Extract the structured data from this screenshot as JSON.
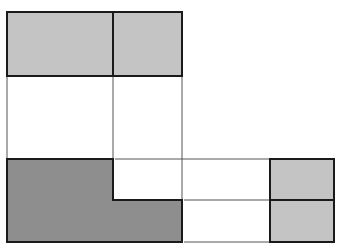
{
  "diagram": {
    "colors": {
      "light_fill": "#c4c4c4",
      "dark_fill": "#8e8e8e",
      "outline": "#1a1a1a",
      "projection_line": "#555555",
      "background": "#ffffff"
    },
    "views": {
      "top_view": {
        "cells": [
          {
            "x": 7,
            "y": 12,
            "w": 106,
            "h": 64
          },
          {
            "x": 113,
            "y": 12,
            "w": 69,
            "h": 64
          }
        ]
      },
      "front_view": {
        "shape": "L-shape",
        "points": "7,159 113,159 113,200 182,200 182,242 7,242"
      },
      "side_view": {
        "cells": [
          {
            "x": 270,
            "y": 159,
            "w": 64,
            "h": 41
          },
          {
            "x": 270,
            "y": 200,
            "w": 64,
            "h": 42
          }
        ]
      }
    },
    "projection_lines": {
      "vertical": [
        {
          "x": 7,
          "y1": 76,
          "y2": 159
        },
        {
          "x": 113,
          "y1": 76,
          "y2": 159
        },
        {
          "x": 182,
          "y1": 76,
          "y2": 200
        }
      ],
      "horizontal": [
        {
          "y": 159,
          "x1": 115,
          "x2": 270
        },
        {
          "y": 200,
          "x1": 184,
          "x2": 270
        },
        {
          "y": 242,
          "x1": 184,
          "x2": 270
        }
      ]
    }
  }
}
